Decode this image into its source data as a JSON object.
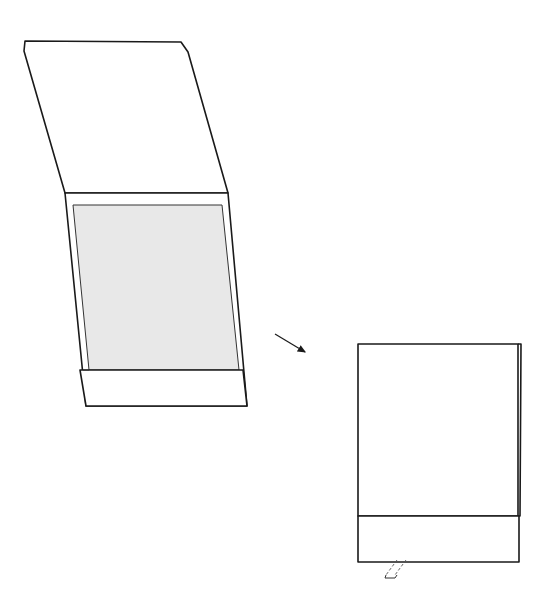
{
  "diagram": {
    "colors": {
      "background": "#ffffff",
      "line": "#1a1a1a",
      "inner_panel_fill": "#e8e8e8"
    },
    "figures": [
      {
        "id": "open-folder",
        "parts": [
          "top-flap",
          "body-frame",
          "inner-panel",
          "bottom-pocket"
        ]
      },
      {
        "id": "transition-arrow",
        "direction": "down-right"
      },
      {
        "id": "closed-folder",
        "parts": [
          "front-cover",
          "bottom-pocket",
          "side-edge",
          "tab-pull-indicator"
        ]
      }
    ]
  }
}
